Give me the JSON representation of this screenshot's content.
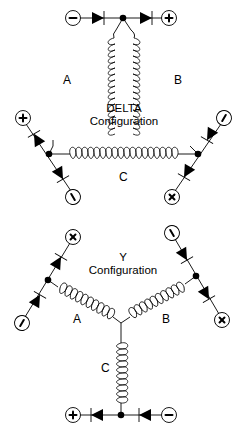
{
  "delta": {
    "title_line1": "DELTA",
    "title_line2": "Configuration",
    "coil_labels": {
      "a": "A",
      "b": "B",
      "c": "C"
    },
    "terminals": {
      "top_left": "negative",
      "top_right": "positive",
      "left_upper": "positive",
      "left_lower": "negative",
      "right_upper": "negative",
      "right_lower": "positive"
    }
  },
  "wye": {
    "title_line1": "Y",
    "title_line2": "Configuration",
    "coil_labels": {
      "a": "A",
      "b": "B",
      "c": "C"
    },
    "terminals": {
      "left_upper": "positive",
      "left_lower": "negative",
      "right_upper": "negative",
      "right_lower": "positive",
      "bottom_left": "positive",
      "bottom_right": "negative"
    }
  },
  "colors": {
    "line": "#000000",
    "background": "#ffffff"
  }
}
